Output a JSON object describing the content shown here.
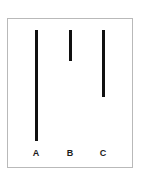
{
  "figure": {
    "background_color": "#ffffff",
    "frame": {
      "border_color": "#b9b9b9",
      "fill_color": "#ffffff"
    },
    "bar_color": "#101010",
    "label_color": "#1b1b1b"
  },
  "chart_data": {
    "type": "bar",
    "orientation": "vertical-hanging",
    "title": "",
    "subtitle": "",
    "xlabel": "",
    "ylabel": "",
    "grid": false,
    "legend": null,
    "categories": [
      "A",
      "B",
      "C"
    ],
    "tick_labels": [
      "A",
      "B",
      "C"
    ],
    "values": [
      111,
      31,
      67
    ],
    "value_unit": "px",
    "series": [
      {
        "name": "bar length",
        "values": [
          111,
          31,
          67
        ]
      }
    ],
    "ylim": [
      0,
      120
    ],
    "annotations": [],
    "bars": [
      {
        "label": "A",
        "length": 111,
        "width": 3,
        "left": 27,
        "top": 11,
        "label_left": 21
      },
      {
        "label": "B",
        "length": 31,
        "width": 3,
        "left": 61,
        "top": 11,
        "label_left": 55
      },
      {
        "label": "C",
        "length": 67,
        "width": 3,
        "left": 94,
        "top": 11,
        "label_left": 88
      }
    ]
  }
}
